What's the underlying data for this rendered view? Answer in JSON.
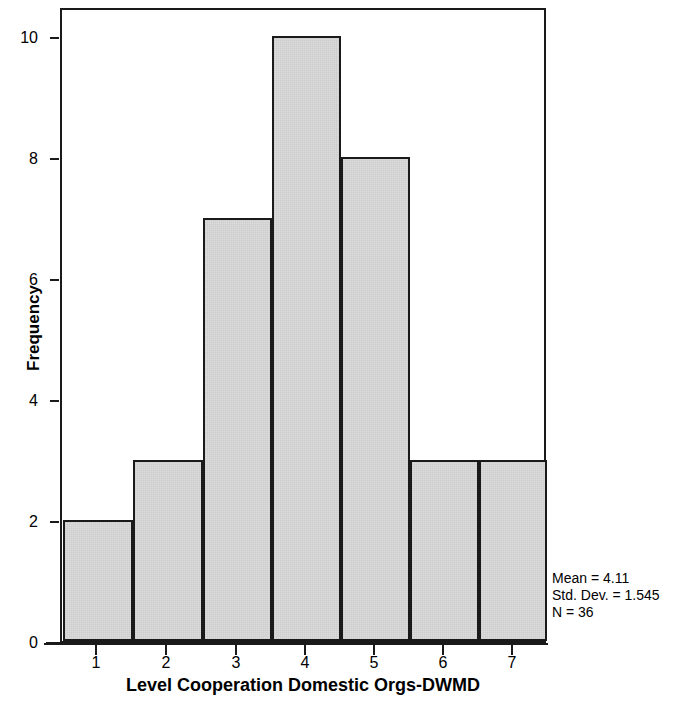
{
  "chart_data": {
    "type": "bar",
    "title": "",
    "subtitle": "",
    "xlabel": "Level Cooperation Domestic Orgs-DWMD",
    "ylabel": "Frequency",
    "categories": [
      "1",
      "2",
      "3",
      "4",
      "5",
      "6",
      "7"
    ],
    "values": [
      2,
      3,
      7,
      10,
      8,
      3,
      3
    ],
    "xlim": [
      0.5,
      7.5
    ],
    "ylim": [
      0,
      10.5
    ],
    "x_ticks": [
      "1",
      "2",
      "3",
      "4",
      "5",
      "6",
      "7"
    ],
    "y_ticks": [
      "0",
      "2",
      "4",
      "6",
      "8",
      "10"
    ],
    "y_tick_values": [
      0,
      2,
      4,
      6,
      8,
      10
    ],
    "grid": false,
    "legend": false,
    "bar_fill_color": "#d9d9d9",
    "bar_edge_color": "#1a1a1a",
    "background_color": "#ffffff",
    "annotations": [
      "Mean = 4.11",
      "Std. Dev. = 1.545",
      "N = 36"
    ]
  },
  "statistics": {
    "mean_label": "Mean = 4.11",
    "std_dev_label": "Std. Dev. = 1.545",
    "n_label": "N = 36"
  },
  "axes": {
    "y_title": "Frequency",
    "x_title": "Level Cooperation Domestic Orgs-DWMD",
    "y_labels": [
      "10",
      "8",
      "6",
      "4",
      "2",
      "0"
    ],
    "x_labels": [
      "1",
      "2",
      "3",
      "4",
      "5",
      "6",
      "7"
    ]
  }
}
